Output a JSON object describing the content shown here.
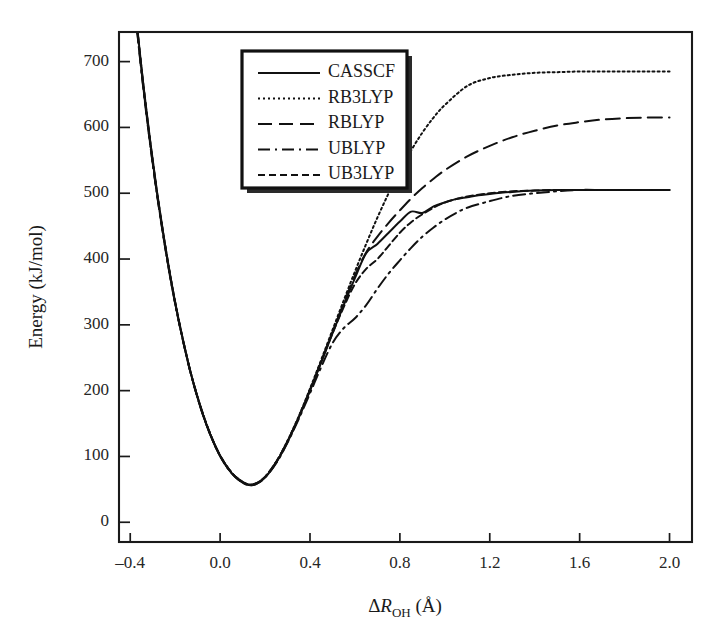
{
  "chart_data": {
    "type": "line",
    "title": "",
    "xlabel": "ΔR_OH (Å)",
    "ylabel": "Energy (kJ/mol)",
    "xlabel_parts": {
      "delta": "Δ",
      "symbol": "R",
      "subscript": "OH",
      "unit": "(Å)"
    },
    "xlim": [
      -0.45,
      2.1
    ],
    "ylim": [
      -30,
      745
    ],
    "xticks": [
      -0.4,
      0.0,
      0.4,
      0.8,
      1.2,
      1.6,
      2.0
    ],
    "xticklabels": [
      "–0.4",
      "0.0",
      "0.4",
      "0.8",
      "1.2",
      "1.6",
      "2.0"
    ],
    "yticks": [
      0,
      100,
      200,
      300,
      400,
      500,
      600,
      700
    ],
    "yticklabels": [
      "0",
      "100",
      "200",
      "300",
      "400",
      "500",
      "600",
      "700"
    ],
    "grid": false,
    "legend_position": "upper center-left",
    "series": [
      {
        "name": "CASSCF",
        "dash": "none",
        "asymptote": 505,
        "x": [
          -0.37,
          -0.34,
          -0.31,
          -0.28,
          -0.25,
          -0.22,
          -0.19,
          -0.16,
          -0.13,
          -0.1,
          -0.07,
          -0.04,
          -0.01,
          0.02,
          0.05,
          0.08,
          0.12,
          0.16,
          0.2,
          0.25,
          0.3,
          0.35,
          0.4,
          0.45,
          0.5,
          0.55,
          0.6,
          0.65,
          0.7,
          0.75,
          0.8,
          0.85,
          0.9,
          0.95,
          1.0,
          1.05,
          1.1,
          1.15,
          1.2,
          1.3,
          1.4,
          1.5,
          1.6,
          1.7,
          1.8,
          1.9,
          2.0
        ],
        "y": [
          755,
          660,
          576,
          500,
          432,
          371,
          317,
          269,
          226,
          189,
          157,
          130,
          107,
          89,
          75,
          65,
          57,
          58,
          68,
          91,
          122,
          159,
          200,
          243,
          287,
          330,
          371,
          409,
          423,
          440,
          457,
          472,
          470,
          480,
          486,
          491,
          494,
          497,
          499,
          502,
          504,
          505,
          505,
          505,
          505,
          505,
          505
        ]
      },
      {
        "name": "RB3LYP",
        "dash": "2,3",
        "asymptote": 685,
        "x": [
          -0.37,
          -0.34,
          -0.31,
          -0.28,
          -0.25,
          -0.22,
          -0.19,
          -0.16,
          -0.13,
          -0.1,
          -0.07,
          -0.04,
          -0.01,
          0.02,
          0.05,
          0.08,
          0.12,
          0.16,
          0.2,
          0.25,
          0.3,
          0.35,
          0.4,
          0.45,
          0.5,
          0.55,
          0.6,
          0.65,
          0.7,
          0.75,
          0.8,
          0.85,
          0.9,
          0.95,
          1.0,
          1.1,
          1.2,
          1.3,
          1.4,
          1.5,
          1.6,
          1.7,
          1.8,
          1.9,
          2.0
        ],
        "y": [
          752,
          658,
          574,
          498,
          431,
          370,
          316,
          269,
          226,
          190,
          158,
          131,
          108,
          90,
          76,
          66,
          58,
          59,
          69,
          92,
          124,
          161,
          203,
          247,
          292,
          337,
          381,
          423,
          463,
          500,
          534,
          565,
          592,
          615,
          634,
          663,
          675,
          680,
          683,
          684,
          685,
          685,
          685,
          685,
          685
        ]
      },
      {
        "name": "RBLYP",
        "dash": "14,7",
        "asymptote": 615,
        "x": [
          -0.37,
          -0.34,
          -0.31,
          -0.28,
          -0.25,
          -0.22,
          -0.19,
          -0.16,
          -0.13,
          -0.1,
          -0.07,
          -0.04,
          -0.01,
          0.02,
          0.05,
          0.08,
          0.12,
          0.16,
          0.2,
          0.25,
          0.3,
          0.35,
          0.4,
          0.45,
          0.5,
          0.55,
          0.6,
          0.65,
          0.7,
          0.75,
          0.8,
          0.85,
          0.9,
          0.95,
          1.0,
          1.1,
          1.2,
          1.3,
          1.4,
          1.5,
          1.6,
          1.7,
          1.8,
          1.9,
          2.0
        ],
        "y": [
          750,
          656,
          572,
          497,
          430,
          369,
          316,
          268,
          226,
          189,
          157,
          130,
          108,
          90,
          76,
          66,
          58,
          59,
          69,
          92,
          123,
          160,
          201,
          245,
          289,
          333,
          375,
          410,
          434,
          455,
          474,
          492,
          508,
          522,
          535,
          556,
          572,
          585,
          595,
          603,
          608,
          612,
          614,
          615,
          615
        ]
      },
      {
        "name": "UBLYP",
        "dash": "12,5,2,5",
        "asymptote": 505,
        "x": [
          -0.37,
          -0.34,
          -0.31,
          -0.28,
          -0.25,
          -0.22,
          -0.19,
          -0.16,
          -0.13,
          -0.1,
          -0.07,
          -0.04,
          -0.01,
          0.02,
          0.05,
          0.08,
          0.12,
          0.16,
          0.2,
          0.25,
          0.3,
          0.35,
          0.4,
          0.45,
          0.5,
          0.55,
          0.6,
          0.65,
          0.7,
          0.75,
          0.8,
          0.85,
          0.9,
          0.95,
          1.0,
          1.05,
          1.1,
          1.2,
          1.3,
          1.4,
          1.5,
          1.6,
          1.7,
          1.8,
          1.9,
          2.0
        ],
        "y": [
          748,
          654,
          571,
          496,
          429,
          368,
          315,
          268,
          225,
          189,
          157,
          130,
          107,
          89,
          75,
          65,
          57,
          58,
          68,
          90,
          121,
          157,
          196,
          236,
          272,
          295,
          310,
          330,
          355,
          378,
          398,
          417,
          434,
          448,
          460,
          470,
          478,
          488,
          496,
          500,
          503,
          505,
          505,
          505,
          505,
          505
        ]
      },
      {
        "name": "UB3LYP",
        "dash": "7,4",
        "asymptote": 505,
        "x": [
          -0.37,
          -0.34,
          -0.31,
          -0.28,
          -0.25,
          -0.22,
          -0.19,
          -0.16,
          -0.13,
          -0.1,
          -0.07,
          -0.04,
          -0.01,
          0.02,
          0.05,
          0.08,
          0.12,
          0.16,
          0.2,
          0.25,
          0.3,
          0.35,
          0.4,
          0.45,
          0.5,
          0.55,
          0.6,
          0.65,
          0.7,
          0.75,
          0.8,
          0.85,
          0.9,
          0.95,
          1.0,
          1.05,
          1.1,
          1.2,
          1.3,
          1.4,
          1.5,
          1.6,
          1.7,
          1.8,
          1.9,
          2.0
        ],
        "y": [
          754,
          659,
          575,
          499,
          432,
          371,
          317,
          269,
          226,
          190,
          158,
          131,
          108,
          90,
          76,
          66,
          58,
          59,
          69,
          92,
          123,
          160,
          201,
          244,
          287,
          327,
          362,
          385,
          400,
          420,
          440,
          456,
          468,
          478,
          486,
          491,
          495,
          500,
          503,
          504,
          505,
          505,
          505,
          505,
          505,
          505
        ]
      }
    ]
  },
  "legend": {
    "entries": [
      {
        "label": "CASSCF"
      },
      {
        "label": "RB3LYP"
      },
      {
        "label": "RBLYP"
      },
      {
        "label": "UBLYP"
      },
      {
        "label": "UB3LYP"
      }
    ]
  },
  "colors": {
    "ink": "#111111",
    "background": "#ffffff",
    "axis": "#1a1a1a"
  }
}
